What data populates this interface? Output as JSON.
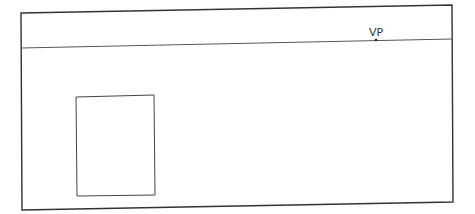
{
  "diagram": {
    "title": "",
    "vanishing_point": {
      "label": "VP",
      "x": 376,
      "y": 40
    },
    "frame": {
      "points": [
        [
          21,
          13
        ],
        [
          452,
          5
        ],
        [
          453,
          202
        ],
        [
          22,
          210
        ]
      ],
      "stroke": "#333333"
    },
    "horizon": {
      "x1": 21,
      "y1": 48,
      "x2": 452,
      "y2": 39,
      "stroke": "#555555"
    },
    "rectangle": {
      "points": [
        [
          76,
          97
        ],
        [
          154,
          95
        ],
        [
          155,
          195
        ],
        [
          77,
          196
        ]
      ],
      "stroke": "#444444"
    }
  }
}
